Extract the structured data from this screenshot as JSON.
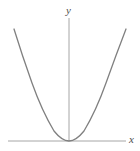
{
  "figure": {
    "kind": "cartesian-plot",
    "width": 140,
    "height": 151,
    "background": "#ffffff"
  },
  "axes": {
    "x_label": "x",
    "y_label": "y",
    "axis_color": "#a6a6a6",
    "axis_width": 1,
    "origin": {
      "x": 69,
      "y": 141
    },
    "x_axis": {
      "x_start": 8,
      "x_end": 126,
      "y": 141
    },
    "y_axis": {
      "x": 69,
      "y_start": 18,
      "y_end": 141
    },
    "ticks": [],
    "tick_labels": [],
    "grid": false
  },
  "curve": {
    "name": "parabola",
    "color": "#808080",
    "width": 1.3,
    "equation": "y = a x^2",
    "vertex": {
      "x": 0,
      "y": 0
    },
    "opens": "up",
    "path": "M 14 29 Q 22 55 32 83 Q 42 111 54 131 Q 62 141 69 141 Q 76 141 84 131 Q 96 111 106 83 Q 116 55 126 29"
  },
  "chart_data": {
    "type": "line",
    "title": "",
    "xlabel": "x",
    "ylabel": "y",
    "grid": false,
    "legend": null,
    "series": [
      {
        "name": "parabola",
        "equation": "y = x^2",
        "x": [
          -5,
          -4,
          -3,
          -2,
          -1,
          0,
          1,
          2,
          3,
          4,
          5
        ],
        "values": [
          25,
          16,
          9,
          4,
          1,
          0,
          1,
          4,
          9,
          16,
          25
        ]
      }
    ],
    "xlim": [
      -5.4,
      5.4
    ],
    "ylim": [
      0,
      27
    ],
    "annotations": []
  }
}
